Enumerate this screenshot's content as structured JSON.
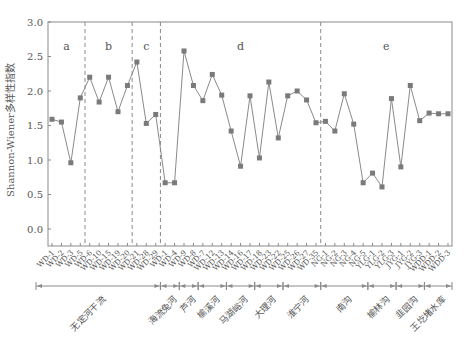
{
  "chart_data": {
    "type": "line",
    "title": "",
    "xlabel": "",
    "ylabel": "Shannon-Wiener多样性指数",
    "ylim": [
      -0.25,
      3.0
    ],
    "yticks": [
      "0.0",
      "0.5",
      "1.0",
      "1.5",
      "2.0",
      "2.5",
      "3.0"
    ],
    "grid": false,
    "legend": null,
    "x": [
      "WD-1",
      "WD-2",
      "WD-3",
      "WD-5",
      "WD-6",
      "WD-10",
      "WD-15",
      "WD-19",
      "WD-20",
      "WD-21",
      "WD-28",
      "WD-29",
      "WD-1",
      "WD-4",
      "WD-9",
      "WD-8",
      "WD-7",
      "WD-12",
      "WD-13",
      "WD-14",
      "WD-16",
      "WD-17",
      "WD-18",
      "WD-23",
      "WD-22",
      "WD-25",
      "WD-26",
      "WD-27",
      "WD-35",
      "NG-1",
      "NG-2",
      "NG-3",
      "NG-4",
      "NG-5",
      "YLG-1",
      "YLG-2",
      "YLG-3",
      "JYG-1",
      "JYG-2",
      "JYG-3",
      "WDD-1",
      "WDD-2",
      "WDD-3"
    ],
    "series": [
      {
        "name": "Shannon-Wiener多样性指数",
        "values": [
          1.59,
          1.55,
          0.96,
          1.9,
          2.2,
          1.84,
          2.2,
          1.7,
          2.08,
          2.42,
          1.53,
          1.66,
          0.67,
          0.67,
          2.58,
          2.08,
          1.86,
          2.24,
          1.94,
          1.42,
          0.91,
          1.93,
          1.03,
          2.13,
          1.32,
          1.93,
          2.0,
          1.87,
          1.54,
          1.56,
          1.42,
          1.96,
          1.52,
          0.67,
          0.81,
          0.61,
          1.89,
          0.9,
          2.08,
          1.57,
          1.68,
          1.67,
          1.67
        ]
      }
    ],
    "region_labels": [
      {
        "label": "a",
        "from": 0,
        "to": 3
      },
      {
        "label": "b",
        "from": 4,
        "to": 8
      },
      {
        "label": "c",
        "from": 9,
        "to": 11
      },
      {
        "label": "d",
        "from": 12,
        "to": 28
      },
      {
        "label": "e",
        "from": 29,
        "to": 42
      }
    ],
    "region_dividers_after_index": [
      3,
      8,
      11,
      28
    ],
    "river_groups": [
      {
        "label": "无定河干流",
        "from": 0,
        "to": 11
      },
      {
        "label": "海流兔河",
        "from": 12,
        "to": 13
      },
      {
        "label": "芦河",
        "from": 14,
        "to": 15
      },
      {
        "label": "榆溪河",
        "from": 16,
        "to": 18
      },
      {
        "label": "马湖峪河",
        "from": 19,
        "to": 21
      },
      {
        "label": "大理河",
        "from": 22,
        "to": 24
      },
      {
        "label": "淮宁河",
        "from": 25,
        "to": 28
      },
      {
        "label": "南沟",
        "from": 29,
        "to": 33
      },
      {
        "label": "榆林沟",
        "from": 34,
        "to": 36
      },
      {
        "label": "韭园沟",
        "from": 37,
        "to": 39
      },
      {
        "label": "王圪堵水库",
        "from": 40,
        "to": 42
      }
    ],
    "colors": {
      "line": "#8a8a8a",
      "marker": "#7a7a7a",
      "axis": "#8a8a8a",
      "divider": "#8a8a8a",
      "text": "#555555"
    }
  }
}
